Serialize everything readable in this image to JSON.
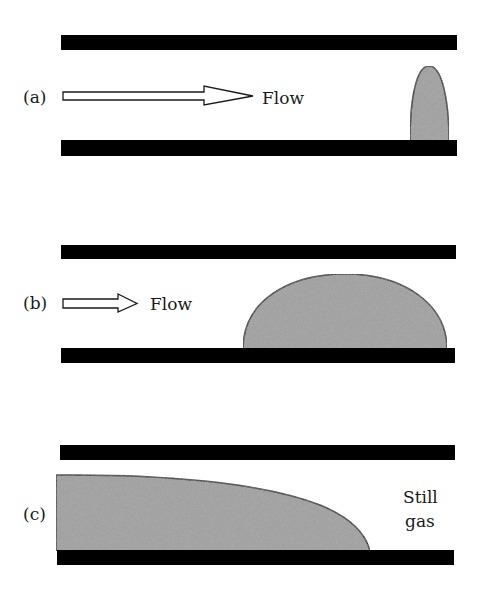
{
  "figure": {
    "colors": {
      "wall": "#000000",
      "liquid": "#9a9a9a",
      "outline": "#1a1a1a",
      "background": "#ffffff"
    },
    "panels": [
      {
        "id": "a",
        "label": "(a)",
        "arrow_label": "Flow",
        "state": "tall narrow droplet near right end, strong flow"
      },
      {
        "id": "b",
        "label": "(b)",
        "arrow_label": "Flow",
        "state": "wide dome-shaped droplet, weaker flow"
      },
      {
        "id": "c",
        "label": "(c)",
        "side_label_line1": "Still",
        "side_label_line2": "gas",
        "state": "liquid film filling channel from left, no flow"
      }
    ]
  }
}
